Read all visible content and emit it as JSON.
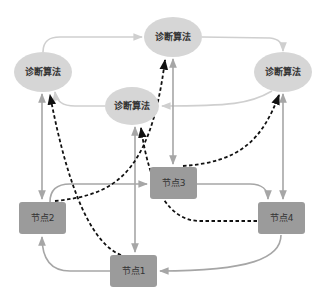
{
  "diagram": {
    "type": "network-diagram",
    "colors": {
      "ellipse_fill": "#d6d6d6",
      "node_fill": "#9b9b9b",
      "solid_edge_light": "#cfcfcf",
      "solid_edge": "#a6a6a6",
      "dashed_edge": "#111111",
      "text": "#333333"
    },
    "ellipses": [
      {
        "id": "algo-top",
        "label": "诊断算法",
        "cx": 173,
        "cy": 37,
        "rx": 29,
        "ry": 20
      },
      {
        "id": "algo-left",
        "label": "诊断算法",
        "cx": 43,
        "cy": 72,
        "rx": 29,
        "ry": 20
      },
      {
        "id": "algo-right",
        "label": "诊断算法",
        "cx": 283,
        "cy": 72,
        "rx": 29,
        "ry": 20
      },
      {
        "id": "algo-middle",
        "label": "诊断算法",
        "cx": 132,
        "cy": 106,
        "rx": 27,
        "ry": 19
      }
    ],
    "nodes": [
      {
        "id": "node1",
        "label": "节点1",
        "x": 110,
        "y": 255,
        "w": 47,
        "h": 32
      },
      {
        "id": "node2",
        "label": "节点2",
        "x": 19,
        "y": 202,
        "w": 47,
        "h": 32
      },
      {
        "id": "node3",
        "label": "节点3",
        "x": 150,
        "y": 167,
        "w": 47,
        "h": 32
      },
      {
        "id": "node4",
        "label": "节点4",
        "x": 258,
        "y": 202,
        "w": 47,
        "h": 32
      }
    ],
    "edges": [
      {
        "from": "algo-left",
        "to": "algo-top",
        "style": "solid-light"
      },
      {
        "from": "algo-top",
        "to": "algo-right",
        "style": "solid-light"
      },
      {
        "from": "algo-right",
        "to": "algo-middle",
        "style": "solid-light"
      },
      {
        "from": "algo-middle",
        "to": "algo-left",
        "style": "solid-light"
      },
      {
        "from": "algo-left",
        "to": "node2",
        "style": "solid",
        "bidirectional": true
      },
      {
        "from": "algo-top",
        "to": "node3",
        "style": "solid",
        "bidirectional": true
      },
      {
        "from": "algo-right",
        "to": "node4",
        "style": "solid",
        "bidirectional": true
      },
      {
        "from": "algo-middle",
        "to": "node1",
        "style": "solid",
        "bidirectional": true
      },
      {
        "from": "node2",
        "to": "node3",
        "style": "solid"
      },
      {
        "from": "node3",
        "to": "node4",
        "style": "solid"
      },
      {
        "from": "node4",
        "to": "node1",
        "style": "solid"
      },
      {
        "from": "node1",
        "to": "node2",
        "style": "solid"
      },
      {
        "from": "node1",
        "to": "algo-left",
        "style": "dashed"
      },
      {
        "from": "node2",
        "to": "algo-top",
        "style": "dashed"
      },
      {
        "from": "node3",
        "to": "algo-right",
        "style": "dashed"
      },
      {
        "from": "node4",
        "to": "algo-middle",
        "style": "dashed"
      }
    ]
  }
}
